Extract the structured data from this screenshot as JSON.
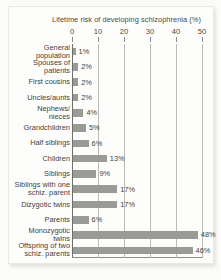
{
  "chart_data": {
    "type": "bar",
    "orientation": "horizontal",
    "title": "Lifetime risk of  developing schizophrenia (%)",
    "xlabel": "",
    "ylabel": "",
    "xlim": [
      0,
      50
    ],
    "xticks": [
      0,
      10,
      20,
      30,
      40,
      50
    ],
    "xtick_labels": [
      "0",
      "10",
      "20",
      "30",
      "40",
      "50"
    ],
    "grid": true,
    "grid_axis": "x",
    "legend": false,
    "bar_color": "#9a9a97",
    "categories": [
      "General\npopulation",
      "Spouses of\npatients",
      "First cousins",
      "Uncles/aunts",
      "Nephews/\nnieces",
      "Grandchildren",
      "Half siblings",
      "Children",
      "Siblings",
      "Siblings with one\nschiz. parent",
      "Dizygotic twins",
      "Parents",
      "Monozygotic\ntwins",
      "Offspring of two\nschiz. parents"
    ],
    "values": [
      1,
      2,
      2,
      2,
      4,
      5,
      6,
      13,
      9,
      17,
      17,
      6,
      48,
      46
    ],
    "value_labels": [
      "1%",
      "2%",
      "2%",
      "2%",
      "4%",
      "5%",
      "6%",
      "13%",
      "9%",
      "17%",
      "17%",
      "6%",
      "48%",
      "46%"
    ]
  }
}
